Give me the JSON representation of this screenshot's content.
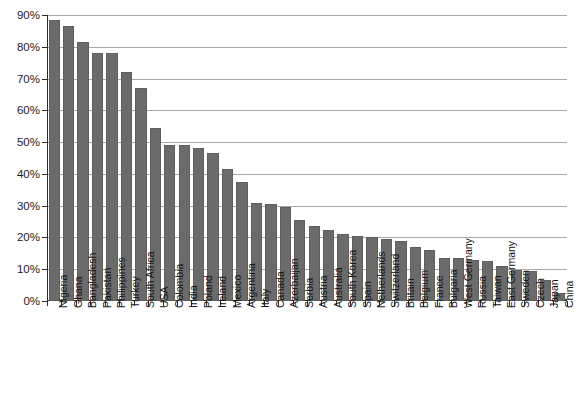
{
  "chart_data": {
    "type": "bar",
    "title": "",
    "xlabel": "",
    "ylabel": "",
    "ylim": [
      0,
      90
    ],
    "grid": true,
    "legend": false,
    "bar_color": "#6b6b6b",
    "axis_color": "#2b2b2b",
    "gridline_color": "#a9a9a9",
    "ytick_labels": [
      "0%",
      "10%",
      "20%",
      "30%",
      "40%",
      "50%",
      "60%",
      "70%",
      "80%",
      "90%"
    ],
    "ytick_values": [
      0,
      10,
      20,
      30,
      40,
      50,
      60,
      70,
      80,
      90
    ],
    "categories": [
      "Nigeria",
      "Ghana",
      "Bangladesh",
      "Pakistan",
      "Philippines",
      "Turkey",
      "South Africa",
      "USA",
      "Colombia",
      "India",
      "Poland",
      "Ireland",
      "Mexico",
      "Argentina",
      "Italy",
      "Canada",
      "Azerbaijan",
      "Serbia",
      "Austria",
      "Australia",
      "South Korea",
      "Spain",
      "Netherlands",
      "Switzerland",
      "Britain",
      "Belgium",
      "France",
      "Bulgaria",
      "West Germany",
      "Russia",
      "Taiwan",
      "East Germany",
      "Sweden",
      "Czech",
      "Japan",
      "China"
    ],
    "values": [
      88.5,
      86.5,
      81.5,
      78.0,
      78.0,
      72.0,
      67.0,
      54.5,
      49.0,
      49.0,
      48.0,
      46.5,
      41.5,
      37.5,
      31.0,
      30.5,
      29.5,
      25.5,
      23.5,
      22.5,
      21.0,
      20.5,
      20.0,
      19.5,
      19.0,
      17.0,
      16.0,
      13.5,
      13.5,
      13.0,
      12.5,
      11.0,
      9.8,
      9.3,
      6.5,
      2.5
    ]
  }
}
